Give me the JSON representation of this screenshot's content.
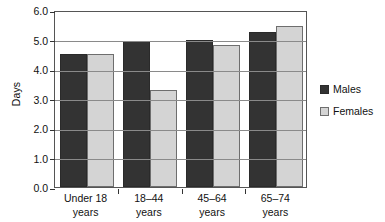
{
  "chart_data": {
    "type": "bar",
    "title": "",
    "xlabel": "",
    "ylabel": "Days",
    "ylim": [
      0.0,
      6.0
    ],
    "ytick_step": 1.0,
    "yticks": [
      "0.0",
      "1.0",
      "2.0",
      "3.0",
      "4.0",
      "5.0",
      "6.0"
    ],
    "grid": "horizontal",
    "legend_position": "right-outside",
    "categories": [
      "Under 18\nyears",
      "18–44\nyears",
      "45–64\nyears",
      "65–74\nyears"
    ],
    "series": [
      {
        "name": "Males",
        "color": "#333333",
        "values": [
          4.5,
          4.95,
          5.0,
          5.25
        ]
      },
      {
        "name": "Females",
        "color": "#d4d4d4",
        "values": [
          4.5,
          3.3,
          4.8,
          5.45
        ]
      }
    ]
  },
  "legend": {
    "items": [
      {
        "label": "Males"
      },
      {
        "label": "Females"
      }
    ]
  }
}
